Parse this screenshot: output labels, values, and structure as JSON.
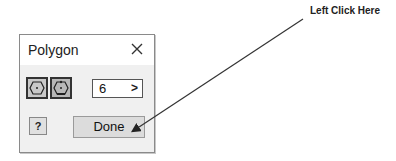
{
  "dialog": {
    "title": "Polygon",
    "close_icon": "close-icon",
    "shape_options": [
      {
        "name": "inscribed-polygon",
        "icon": "hexagon-inscribed-icon",
        "selected": false
      },
      {
        "name": "circumscribed-polygon",
        "icon": "hexagon-circumscribed-icon",
        "selected": true
      }
    ],
    "sides": {
      "value": "6",
      "arrow": ">"
    },
    "help_label": "?",
    "done_label": "Done"
  },
  "annotation": {
    "callout_text": "Left Click Here"
  }
}
